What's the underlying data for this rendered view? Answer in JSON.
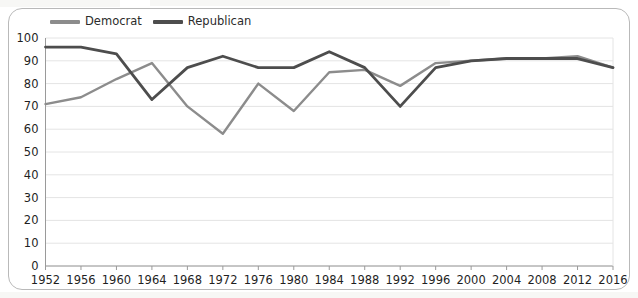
{
  "legend": {
    "position": "top-left",
    "entries": [
      {
        "label": "Democrat",
        "color": "#8c8c8c",
        "icon": "line-swatch-icon"
      },
      {
        "label": "Republican",
        "color": "#4d4d4d",
        "icon": "line-swatch-icon"
      }
    ]
  },
  "chart_data": {
    "type": "line",
    "title": "",
    "subtitle": "",
    "xlabel": "",
    "ylabel": "",
    "grid": true,
    "legend_position": "top-left",
    "xlim": [
      1952,
      2016
    ],
    "ylim": [
      0,
      100
    ],
    "ytick_step": 10,
    "yticks": [
      0,
      10,
      20,
      30,
      40,
      50,
      60,
      70,
      80,
      90,
      100
    ],
    "ytick_labels": [
      "0",
      "10",
      "20",
      "30",
      "40",
      "50",
      "60",
      "70",
      "80",
      "90",
      "100"
    ],
    "x": [
      1952,
      1956,
      1960,
      1964,
      1968,
      1972,
      1976,
      1980,
      1984,
      1988,
      1992,
      1996,
      2000,
      2004,
      2008,
      2012,
      2016
    ],
    "xtick_labels": [
      "1952",
      "1956",
      "1960",
      "1964",
      "1968",
      "1972",
      "1976",
      "1980",
      "1984",
      "1988",
      "1992",
      "1996",
      "2000",
      "2004",
      "2008",
      "2012",
      "2016"
    ],
    "series": [
      {
        "name": "Democrat",
        "color": "#8c8c8c",
        "width": 2.4,
        "values": [
          71,
          74,
          82,
          89,
          70,
          58,
          80,
          68,
          85,
          86,
          79,
          89,
          90,
          91,
          91,
          92,
          87
        ]
      },
      {
        "name": "Republican",
        "color": "#4d4d4d",
        "width": 2.8,
        "values": [
          96,
          96,
          93,
          73,
          87,
          92,
          87,
          87,
          94,
          87,
          70,
          87,
          90,
          91,
          91,
          91,
          87
        ]
      }
    ],
    "annotations": []
  },
  "style": {
    "background": "#ffffff",
    "card_border": "#b9b9b9",
    "grid_color": "#e4e4e4",
    "axis_color": "#9a9a9a",
    "text_color": "#1f1f1f"
  }
}
